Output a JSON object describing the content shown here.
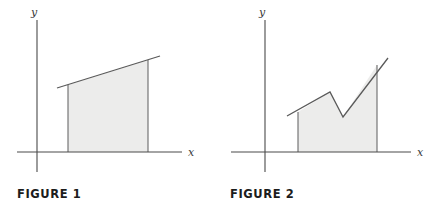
{
  "page": {
    "background": "#ffffff",
    "width": 427,
    "height": 207
  },
  "style": {
    "fill_color": "#ececeb",
    "stroke_color": "#5a5a5a",
    "axis_color": "#4a4a4a",
    "caption_color": "#1c1c1c"
  },
  "figures": [
    {
      "caption": "FIGURE 1",
      "axis": {
        "x_label": "x",
        "y_label": "y",
        "x_axis": {
          "x1": 17,
          "y1": 152,
          "x2": 182,
          "y2": 152
        },
        "y_axis": {
          "x1": 37,
          "y1": 20,
          "x2": 37,
          "y2": 172
        }
      },
      "shape": {
        "type": "region-under-line",
        "description": "Shaded trapezoid under a straight increasing line",
        "fill_points": "68,152 68,85 148,60 148,152",
        "curve_points": "57,88 160,56",
        "left_edge": {
          "x1": 68,
          "y1": 85,
          "x2": 68,
          "y2": 152
        },
        "right_edge": {
          "x1": 148,
          "y1": 60,
          "x2": 148,
          "y2": 152
        },
        "a_x": 68,
        "b_x": 148,
        "baseline_y": 152
      }
    },
    {
      "caption": "FIGURE 2",
      "axis": {
        "x_label": "x",
        "y_label": "y",
        "x_axis": {
          "x1": 18,
          "y1": 152,
          "x2": 198,
          "y2": 152
        },
        "y_axis": {
          "x1": 52,
          "y1": 20,
          "x2": 52,
          "y2": 172
        }
      },
      "shape": {
        "type": "region-under-piecewise-line",
        "description": "Shaded region under a zigzag piecewise-linear graph: rise, peak, dip to valley, steep rise",
        "fill_points": "85,152 85,112 117,92 130,117 164,65 164,152",
        "curve_points": "74,116 117,92 130,117 175,58",
        "left_edge": {
          "x1": 85,
          "y1": 112,
          "x2": 85,
          "y2": 152
        },
        "right_edge": {
          "x1": 164,
          "y1": 65,
          "x2": 164,
          "y2": 152
        },
        "vertices": [
          {
            "x": 85,
            "y": 112,
            "label": "start"
          },
          {
            "x": 117,
            "y": 92,
            "label": "peak"
          },
          {
            "x": 130,
            "y": 117,
            "label": "valley"
          },
          {
            "x": 164,
            "y": 65,
            "label": "end"
          }
        ],
        "a_x": 85,
        "b_x": 164,
        "baseline_y": 152
      }
    }
  ]
}
